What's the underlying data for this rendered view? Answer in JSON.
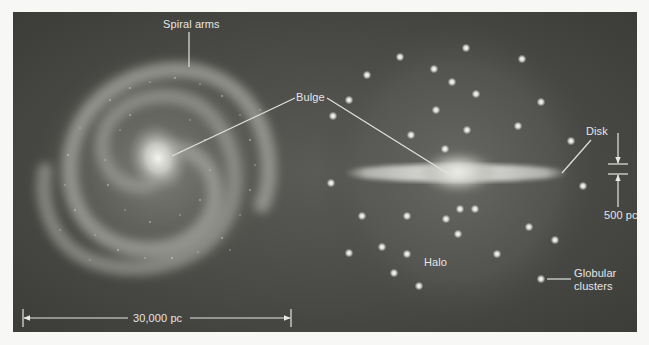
{
  "figure": {
    "background_color": "#f7f7f5",
    "panel_color": "#4a4a46",
    "panel": {
      "x": 13,
      "y": 12,
      "width": 624,
      "height": 320
    }
  },
  "face_on_view": {
    "center": [
      158,
      168
    ],
    "labels": {
      "spiral_arms": "Spiral arms",
      "bulge": "Bulge"
    }
  },
  "edge_on_view": {
    "center": [
      458,
      172
    ],
    "labels": {
      "disk": "Disk",
      "halo": "Halo",
      "globular_clusters_line1": "Globular",
      "globular_clusters_line2": "clusters"
    },
    "globular_clusters": [
      [
        400,
        57
      ],
      [
        367,
        75
      ],
      [
        434,
        69
      ],
      [
        466,
        48
      ],
      [
        522,
        59
      ],
      [
        452,
        82
      ],
      [
        476,
        94
      ],
      [
        349,
        100
      ],
      [
        333,
        116
      ],
      [
        541,
        102
      ],
      [
        436,
        110
      ],
      [
        467,
        130
      ],
      [
        518,
        126
      ],
      [
        411,
        135
      ],
      [
        571,
        141
      ],
      [
        445,
        149
      ],
      [
        331,
        183
      ],
      [
        583,
        186
      ],
      [
        460,
        209
      ],
      [
        475,
        209
      ],
      [
        362,
        216
      ],
      [
        407,
        216
      ],
      [
        446,
        219
      ],
      [
        458,
        234
      ],
      [
        529,
        227
      ],
      [
        555,
        240
      ],
      [
        349,
        253
      ],
      [
        382,
        247
      ],
      [
        407,
        254
      ],
      [
        497,
        254
      ],
      [
        394,
        273
      ],
      [
        419,
        286
      ],
      [
        541,
        279
      ]
    ]
  },
  "scale_bars": {
    "horizontal": {
      "label": "30,000 pc",
      "x1": 23,
      "x2": 291,
      "y": 318
    },
    "vertical": {
      "label": "500 pc",
      "x": 618,
      "y_top": 164,
      "y_bottom": 174
    }
  }
}
